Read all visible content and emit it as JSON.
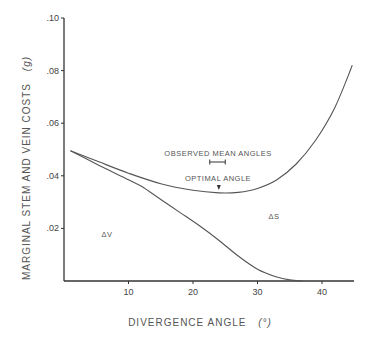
{
  "chart_data": {
    "type": "line",
    "title": "",
    "xlabel": "DIVERGENCE ANGLE (°)",
    "ylabel": "MARGINAL STEM AND VEIN COSTS (g)",
    "xlim": [
      0,
      45
    ],
    "ylim": [
      0,
      0.1
    ],
    "x_ticks": [
      10,
      20,
      30,
      40
    ],
    "x_tick_labels": [
      "10",
      "20",
      "30",
      "40"
    ],
    "y_ticks": [
      0.02,
      0.04,
      0.06,
      0.08,
      0.1
    ],
    "y_tick_labels": [
      ".02",
      ".04",
      ".06",
      ".08",
      ".10"
    ],
    "grid": false,
    "legend": null,
    "series": [
      {
        "name": "upper curve (total marginal cost)",
        "x": [
          1,
          5,
          10,
          15,
          20,
          24,
          27,
          30,
          33,
          36,
          39,
          42,
          44.7
        ],
        "values": [
          0.0495,
          0.0457,
          0.041,
          0.037,
          0.0345,
          0.0335,
          0.0337,
          0.0352,
          0.0385,
          0.0445,
          0.0535,
          0.066,
          0.082
        ]
      },
      {
        "name": "lower curve (ΔV)",
        "x": [
          1,
          5,
          10,
          12,
          15,
          18,
          21,
          24,
          27,
          30,
          33,
          35,
          37
        ],
        "values": [
          0.0495,
          0.0445,
          0.0385,
          0.036,
          0.031,
          0.026,
          0.021,
          0.0155,
          0.0095,
          0.0045,
          0.0015,
          0.0004,
          0.0
        ]
      }
    ],
    "annotations": [
      {
        "text": "OBSERVED MEAN ANGLES",
        "x": 24,
        "y": 0.0455
      },
      {
        "text": "OPTIMAL ANGLE",
        "x": 24,
        "y": 0.0385
      },
      {
        "text": "ΔV",
        "x": 7,
        "y": 0.0175
      },
      {
        "text": "ΔS",
        "x": 33,
        "y": 0.0245
      }
    ],
    "observed_range": [
      22.6,
      25.0
    ],
    "optimal_angle": 24
  },
  "labels": {
    "xlabel": "DIVERGENCE ANGLE",
    "xlabel_unit": "(°)",
    "ylabel": "MARGINAL STEM AND VEIN COSTS",
    "ylabel_unit": "(g)",
    "observed": "OBSERVED MEAN ANGLES",
    "optimal": "OPTIMAL ANGLE",
    "delta_v": "ΔV",
    "delta_s": "ΔS"
  }
}
